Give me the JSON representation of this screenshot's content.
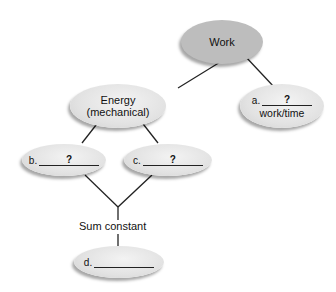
{
  "diagram": {
    "type": "concept-map",
    "nodes": {
      "work": {
        "text": "Work"
      },
      "power": {
        "prefix": "a.",
        "blank": "?",
        "subtext": "work/time"
      },
      "energy": {
        "line1": "Energy",
        "line2": "(mechanical)"
      },
      "kinetic": {
        "prefix": "b.",
        "blank": "?"
      },
      "potential": {
        "prefix": "c.",
        "blank": "?"
      },
      "conservation": {
        "prefix": "d.",
        "blank": ""
      }
    },
    "connector_label": "Sum constant",
    "colors": {
      "work_fill": "#bdbdbd",
      "node_fill": "#e2e2e2",
      "line": "#222222"
    }
  }
}
